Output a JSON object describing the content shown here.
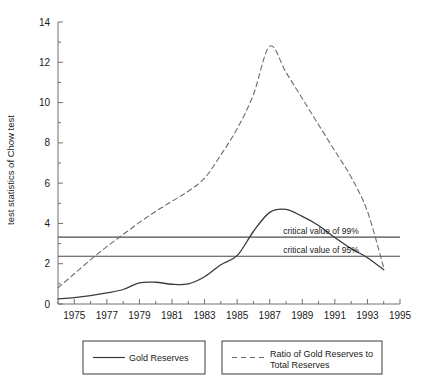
{
  "chart_data": {
    "type": "line",
    "title": "",
    "xlabel": "",
    "ylabel": "test statistics of Chow test",
    "xlim": [
      1974,
      1995
    ],
    "ylim": [
      0,
      14
    ],
    "grid": false,
    "legend_position": "bottom",
    "x_ticks_major": [
      1975,
      1977,
      1979,
      1981,
      1983,
      1985,
      1987,
      1989,
      1991,
      1993,
      1995
    ],
    "x_tick_labels": [
      "1975",
      "1977",
      "1979",
      "1981",
      "1983",
      "1985",
      "1987",
      "1989",
      "1991",
      "1993",
      "1995"
    ],
    "x_ticks_minor": [
      1974,
      1976,
      1978,
      1980,
      1982,
      1984,
      1986,
      1988,
      1990,
      1992,
      1994
    ],
    "y_ticks_major": [
      0,
      2,
      4,
      6,
      8,
      10,
      12,
      14
    ],
    "y_tick_labels": [
      "0",
      "2",
      "4",
      "6",
      "8",
      "10",
      "12",
      "14"
    ],
    "y_ticks_minor": [
      1,
      3,
      5,
      7,
      9,
      11,
      13
    ],
    "series": [
      {
        "name": "Gold Reserves",
        "style": "solid",
        "color": "#3a3a3a",
        "x": [
          1974,
          1975,
          1976,
          1977,
          1978,
          1979,
          1980,
          1981,
          1982,
          1983,
          1984,
          1985,
          1986,
          1987,
          1988,
          1989,
          1990,
          1991,
          1992,
          1993,
          1994
        ],
        "values": [
          0.25,
          0.32,
          0.42,
          0.55,
          0.72,
          1.05,
          1.08,
          0.98,
          1.0,
          1.35,
          1.95,
          2.4,
          3.6,
          4.55,
          4.7,
          4.35,
          3.9,
          3.3,
          2.75,
          2.3,
          1.7
        ]
      },
      {
        "name": "Ratio of Gold Reserves to Total Reserves",
        "style": "dashed",
        "color": "#6b6b6b",
        "x": [
          1974,
          1975,
          1976,
          1977,
          1978,
          1979,
          1980,
          1981,
          1982,
          1983,
          1984,
          1985,
          1986,
          1987,
          1988,
          1989,
          1990,
          1991,
          1992,
          1993,
          1994
        ],
        "values": [
          0.8,
          1.5,
          2.2,
          2.85,
          3.45,
          4.05,
          4.6,
          5.1,
          5.6,
          6.25,
          7.4,
          8.7,
          10.4,
          12.8,
          11.5,
          10.2,
          8.9,
          7.6,
          6.3,
          4.6,
          1.8
        ]
      }
    ],
    "reference_lines": [
      {
        "label": "critical value of 99%",
        "value": 3.32
      },
      {
        "label": "critical value of 95%",
        "value": 2.37
      }
    ]
  },
  "legend": {
    "entries": [
      {
        "label": "Gold Reserves",
        "style": "solid"
      },
      {
        "label": "Ratio of Gold Reserves to Total Reserves",
        "line1": "Ratio of Gold Reserves to",
        "line2": "Total Reserves",
        "style": "dashed"
      }
    ]
  }
}
